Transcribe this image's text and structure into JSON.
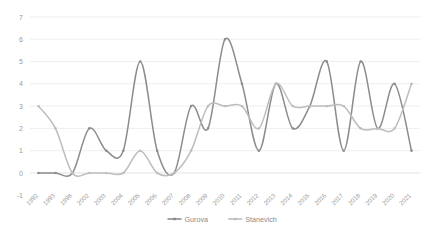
{
  "chart_data": {
    "type": "line",
    "title": "",
    "xlabel": "",
    "ylabel": "",
    "ylim": [
      -1,
      7
    ],
    "ytick_step": 1,
    "grid": "horizontal",
    "legend_position": "bottom-center",
    "smoothed": true,
    "markers": true,
    "categories": [
      "1992",
      "1993",
      "1998",
      "2002",
      "2003",
      "2004",
      "2005",
      "2006",
      "2007",
      "2008",
      "2009",
      "2010",
      "2011",
      "2012",
      "2013",
      "2014",
      "2015",
      "2016",
      "2017",
      "2018",
      "2019",
      "2020",
      "2021"
    ],
    "ytick_labels": [
      "-1",
      "0",
      "1",
      "2",
      "3",
      "4",
      "5",
      "6",
      "7"
    ],
    "series": [
      {
        "name": "Gurova",
        "color": "#8c8c8c",
        "values": [
          0,
          0,
          0,
          2,
          1,
          1,
          5,
          1,
          0,
          3,
          2,
          6,
          4,
          1,
          4,
          2,
          3,
          5,
          1,
          5,
          2,
          4,
          1
        ]
      },
      {
        "name": "Stanevich",
        "color": "#bdbdbd",
        "values": [
          3,
          2,
          0,
          0,
          0,
          0,
          1,
          0,
          0,
          1,
          3,
          3,
          3,
          2,
          4,
          3,
          3,
          3,
          3,
          2,
          2,
          2,
          4
        ]
      }
    ]
  },
  "legend": {
    "items": [
      {
        "label": "Gurova"
      },
      {
        "label": "Stanevich"
      }
    ]
  }
}
